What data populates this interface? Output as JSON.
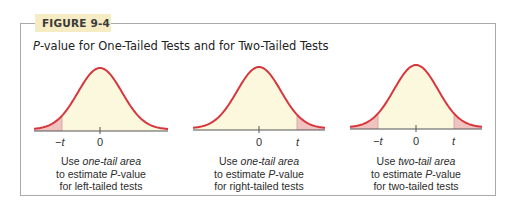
{
  "figure": {
    "tag": "FIGURE 9-4",
    "title_italic": "P",
    "title_rest": "-value for One-Tailed Tests and for Two-Tailed Tests"
  },
  "colors": {
    "frame": "#a9a9a9",
    "tag_bg": "#f6ecc4",
    "curve": "#d8363d",
    "fill": "#fcf8de",
    "tail_fill": "#f1c3c0",
    "axis": "#555555"
  },
  "panels": [
    {
      "type": "left-tailed",
      "shaded": "left",
      "tick_labels": [
        "−t",
        "0"
      ],
      "caption": {
        "line1_pre": "Use ",
        "line1_em": "one-tail area",
        "line2_pre": "to estimate ",
        "line2_em": "P",
        "line2_post": "-value",
        "line3": "for left-tailed tests"
      }
    },
    {
      "type": "right-tailed",
      "shaded": "right",
      "tick_labels": [
        "0",
        "t"
      ],
      "caption": {
        "line1_pre": "Use ",
        "line1_em": "one-tail area",
        "line2_pre": "to estimate ",
        "line2_em": "P",
        "line2_post": "-value",
        "line3": "for right-tailed tests"
      }
    },
    {
      "type": "two-tailed",
      "shaded": "both",
      "tick_labels": [
        "−t",
        "0",
        "t"
      ],
      "caption": {
        "line1_pre": "Use ",
        "line1_em": "two-tail area",
        "line2_pre": "to estimate ",
        "line2_em": "P",
        "line2_post": "-value",
        "line3": "for two-tailed tests"
      }
    }
  ]
}
